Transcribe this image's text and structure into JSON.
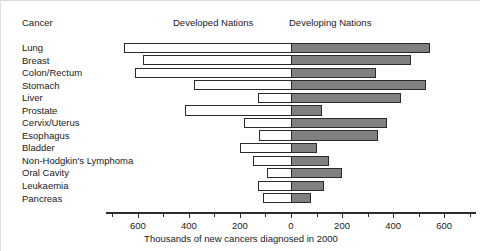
{
  "header": {
    "category_header": "Cancer",
    "left_panel_header": "Developed Nations",
    "right_panel_header": "Developing Nations"
  },
  "axis": {
    "xlabel": "Thousands of new cancers diagnosed in 2000",
    "tick_labels": [
      "600",
      "400",
      "200",
      "0",
      "200",
      "400",
      "600"
    ],
    "tick_values": [
      -600,
      -400,
      -200,
      0,
      200,
      400,
      600
    ],
    "minor_tick_step": 100,
    "range": [
      -725,
      725
    ]
  },
  "colors": {
    "developed_fill": "#ffffff",
    "developing_fill": "#808080",
    "bar_stroke": "#2b2b2b",
    "text": "#1a1a1a",
    "background": "#ffffff"
  },
  "chart_data": {
    "type": "bar",
    "orientation": "horizontal",
    "style": "back-to-back population pyramid",
    "title": "",
    "xlabel": "Thousands of new cancers diagnosed in 2000",
    "ylabel": "Cancer",
    "xlim": [
      -725,
      725
    ],
    "grid": false,
    "legend_position": "top",
    "categories": [
      "Lung",
      "Breast",
      "Colon/Rectum",
      "Stomach",
      "Liver",
      "Prostate",
      "Cervix/Uterus",
      "Esophagus",
      "Bladder",
      "Non-Hodgkin's Lymphoma",
      "Oral Cavity",
      "Leukaemia",
      "Pancreas"
    ],
    "series": [
      {
        "name": "Developed Nations",
        "direction": "left",
        "values": [
          655,
          580,
          610,
          380,
          130,
          415,
          185,
          125,
          200,
          150,
          95,
          130,
          110
        ]
      },
      {
        "name": "Developing Nations",
        "direction": "right",
        "values": [
          545,
          470,
          335,
          530,
          430,
          120,
          375,
          340,
          100,
          150,
          200,
          130,
          80
        ]
      }
    ]
  }
}
